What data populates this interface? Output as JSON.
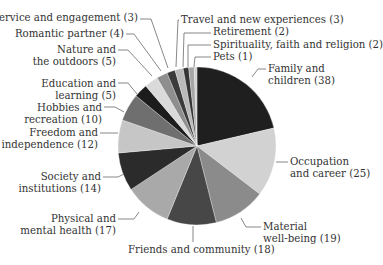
{
  "chart_data": {
    "type": "pie",
    "title": "",
    "start_angle_deg": 0,
    "direction": "clockwise",
    "center": [
      197,
      146
    ],
    "radius": 79,
    "slices": [
      {
        "label": "Family and children",
        "value": 38,
        "color": "#1f1f1f"
      },
      {
        "label": "Occupation and career",
        "value": 25,
        "color": "#d2d2d2"
      },
      {
        "label": "Material well-being",
        "value": 19,
        "color": "#8b8b8b"
      },
      {
        "label": "Friends and community",
        "value": 18,
        "color": "#474747"
      },
      {
        "label": "Physical and mental health",
        "value": 17,
        "color": "#a9a9a9"
      },
      {
        "label": "Society and institutions",
        "value": 14,
        "color": "#2b2b2b"
      },
      {
        "label": "Freedom and independence",
        "value": 12,
        "color": "#c6c6c6"
      },
      {
        "label": "Hobbies and recreation",
        "value": 10,
        "color": "#6f6f6f"
      },
      {
        "label": "Education and learning",
        "value": 5,
        "color": "#1c1c1c"
      },
      {
        "label": "Nature and the outdoors",
        "value": 5,
        "color": "#dadada"
      },
      {
        "label": "Romantic partner",
        "value": 4,
        "color": "#8e8e8e"
      },
      {
        "label": "Service and engagement",
        "value": 3,
        "color": "#3b3b3b"
      },
      {
        "label": "Travel and new experiences",
        "value": 3,
        "color": "#b9b9b9"
      },
      {
        "label": "Retirement",
        "value": 2,
        "color": "#343434"
      },
      {
        "label": "Spirituality, faith and religion",
        "value": 2,
        "color": "#a6a6a6"
      },
      {
        "label": "Pets",
        "value": 1,
        "color": "#d0d0d0"
      }
    ],
    "total": 178
  },
  "labels": [
    {
      "lines": [
        "Family and",
        "children (38)"
      ],
      "x": 268,
      "y": 63,
      "align": "left",
      "line": [
        [
          266,
          69
        ],
        [
          258,
          69
        ],
        [
          252,
          77
        ]
      ]
    },
    {
      "lines": [
        "Occupation",
        "and career (25)"
      ],
      "x": 290,
      "y": 156,
      "align": "left",
      "line": [
        [
          288,
          162
        ],
        [
          276,
          162
        ]
      ]
    },
    {
      "lines": [
        "Material",
        "well-being (19)"
      ],
      "x": 263,
      "y": 221,
      "align": "left",
      "line": [
        [
          261,
          227
        ],
        [
          246,
          227
        ],
        [
          241,
          218
        ]
      ]
    },
    {
      "lines": [
        "Friends and community (18)"
      ],
      "x": 128,
      "y": 244,
      "align": "left",
      "line": [
        [
          193,
          242
        ],
        [
          193,
          226
        ]
      ]
    },
    {
      "lines": [
        "Physical and",
        "mental health (17)"
      ],
      "x": 34,
      "y": 213,
      "align": "right",
      "right": 116,
      "line": [
        [
          118,
          219
        ],
        [
          134,
          219
        ],
        [
          139,
          212
        ]
      ]
    },
    {
      "lines": [
        "Society and",
        "institutions (14)"
      ],
      "x": 20,
      "y": 171,
      "align": "right",
      "right": 101,
      "line": [
        [
          103,
          177
        ],
        [
          118,
          177
        ],
        [
          124,
          174
        ]
      ]
    },
    {
      "lines": [
        "Freedom and",
        "independence (12)"
      ],
      "x": 10,
      "y": 127,
      "align": "right",
      "right": 98,
      "line": [
        [
          100,
          133
        ],
        [
          118,
          133
        ]
      ]
    },
    {
      "lines": [
        "Hobbies and",
        "recreation (10)"
      ],
      "x": 30,
      "y": 102,
      "align": "right",
      "right": 102,
      "line": [
        [
          104,
          107
        ],
        [
          115,
          107
        ],
        [
          124,
          112
        ]
      ]
    },
    {
      "lines": [
        "Education and",
        "learning (5)"
      ],
      "x": 40,
      "y": 78,
      "align": "right",
      "right": 116,
      "line": [
        [
          118,
          83
        ],
        [
          128,
          83
        ],
        [
          137,
          94
        ]
      ]
    },
    {
      "lines": [
        "Nature and",
        "the outdoors (5)"
      ],
      "x": 40,
      "y": 44,
      "align": "right",
      "right": 116,
      "line": [
        [
          118,
          50
        ],
        [
          128,
          50
        ],
        [
          152,
          76
        ]
      ]
    },
    {
      "lines": [
        "Romantic partner (4)"
      ],
      "x": 27,
      "y": 28,
      "align": "right",
      "right": 124,
      "line": [
        [
          126,
          34
        ],
        [
          134,
          34
        ],
        [
          161,
          71
        ]
      ]
    },
    {
      "lines": [
        "Service and engagement (3)"
      ],
      "x": 10,
      "y": 12,
      "align": "right",
      "right": 138,
      "line": [
        [
          140,
          19
        ],
        [
          151,
          19
        ],
        [
          168,
          68
        ]
      ]
    },
    {
      "lines": [
        "Travel and new experiences (3)"
      ],
      "x": 181,
      "y": 14,
      "align": "left",
      "line": [
        [
          179,
          20
        ],
        [
          178,
          20
        ],
        [
          176,
          67
        ]
      ]
    },
    {
      "lines": [
        "Retirement (2)"
      ],
      "x": 213,
      "y": 26,
      "align": "left",
      "line": [
        [
          211,
          33
        ],
        [
          184,
          33
        ],
        [
          183,
          67
        ]
      ]
    },
    {
      "lines": [
        "Spirituality, faith and religion (2)"
      ],
      "x": 213,
      "y": 39,
      "align": "left",
      "line": [
        [
          211,
          45
        ],
        [
          188,
          45
        ],
        [
          188,
          67
        ]
      ]
    },
    {
      "lines": [
        "Pets (1)"
      ],
      "x": 213,
      "y": 51,
      "align": "left",
      "line": [
        [
          211,
          57
        ],
        [
          195,
          57
        ],
        [
          194,
          67
        ]
      ]
    }
  ]
}
